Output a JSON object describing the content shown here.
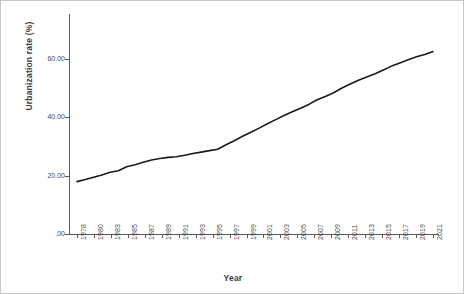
{
  "chart_data": {
    "type": "line",
    "title": "",
    "xlabel": "Year",
    "ylabel": "Urbanization rate (%)",
    "xlim": [
      1978,
      2022
    ],
    "ylim": [
      0,
      70
    ],
    "grid": false,
    "legend": false,
    "line_color": "#1a1a1a",
    "y_ticks": [
      0,
      20,
      40,
      60
    ],
    "y_tick_labels": [
      ".00",
      "20.00",
      "40.00",
      "60.00"
    ],
    "x_tick_labels": [
      "1978",
      "1980",
      "1983",
      "1985",
      "1987",
      "1989",
      "1991",
      "1993",
      "1995",
      "1997",
      "1999",
      "2001",
      "2003",
      "2005",
      "2007",
      "2009",
      "2011",
      "2013",
      "2015",
      "2017",
      "2019",
      "2021"
    ],
    "x": [
      1978,
      1979,
      1980,
      1981,
      1982,
      1983,
      1984,
      1985,
      1986,
      1987,
      1988,
      1989,
      1990,
      1991,
      1992,
      1993,
      1994,
      1995,
      1996,
      1997,
      1998,
      1999,
      2000,
      2001,
      2002,
      2003,
      2004,
      2005,
      2006,
      2007,
      2008,
      2009,
      2010,
      2011,
      2012,
      2013,
      2014,
      2015,
      2016,
      2017,
      2018,
      2019,
      2020,
      2021
    ],
    "values": [
      17.9,
      18.6,
      19.4,
      20.2,
      21.1,
      21.6,
      23.0,
      23.7,
      24.5,
      25.3,
      25.8,
      26.2,
      26.4,
      26.9,
      27.5,
      28.0,
      28.5,
      29.0,
      30.5,
      31.9,
      33.4,
      34.8,
      36.2,
      37.7,
      39.1,
      40.5,
      41.8,
      43.0,
      44.3,
      45.9,
      47.0,
      48.3,
      49.9,
      51.3,
      52.6,
      53.7,
      54.8,
      56.1,
      57.4,
      58.5,
      59.6,
      60.6,
      61.4,
      62.4
    ],
    "ymax_axis_top": 70
  }
}
